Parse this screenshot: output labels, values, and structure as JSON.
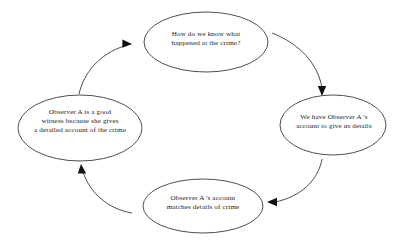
{
  "diagram": {
    "type": "cycle",
    "shape": "ellipse",
    "background_color": "#ffffff",
    "stroke_color": "#3a3a3a",
    "text_color": "#1a1a1a",
    "nodes": [
      {
        "id": "question",
        "name": "How do we know what happened at the crime?",
        "text": "How do we know what\nhappened at the crime?",
        "position": "top",
        "cx": 206,
        "cy": 42,
        "rx": 62,
        "ry": 30
      },
      {
        "id": "account",
        "name": "We have Observer A's account to give us details",
        "text": "We have Observer A 's\naccount to give us details",
        "position": "right",
        "cx": 333,
        "cy": 125,
        "rx": 53,
        "ry": 30
      },
      {
        "id": "matches",
        "name": "Observer A's account matches details of crime",
        "text": "Observer A 's account\nmatches details of crime",
        "position": "bottom",
        "cx": 203,
        "cy": 206,
        "rx": 60,
        "ry": 27
      },
      {
        "id": "witness",
        "name": "Observer A is a good witness because she gives a detailed account of the crime",
        "text": "Observer A is a good\nwitness because she gives\na detailed account of the crime",
        "position": "left",
        "cx": 80,
        "cy": 128,
        "rx": 62,
        "ry": 33
      }
    ],
    "arrows": [
      {
        "id": "arrow-question-to-account",
        "from": "question",
        "to": "account",
        "direction": "clockwise",
        "arrowhead": "down"
      },
      {
        "id": "arrow-account-to-matches",
        "from": "account",
        "to": "matches",
        "direction": "clockwise",
        "arrowhead": "left"
      },
      {
        "id": "arrow-matches-to-witness",
        "from": "matches",
        "to": "witness",
        "direction": "clockwise",
        "arrowhead": "up"
      },
      {
        "id": "arrow-witness-to-question",
        "from": "witness",
        "to": "question",
        "direction": "clockwise",
        "arrowhead": "right"
      }
    ]
  }
}
